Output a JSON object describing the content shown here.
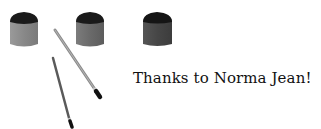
{
  "caption": {
    "text": "Thanks to Norma Jean!"
  },
  "illustration": {
    "paint_pots": [
      {
        "name": "paint-pot-light",
        "body_color": "#8a8a8a"
      },
      {
        "name": "paint-pot-medium",
        "body_color": "#6e6e6e"
      },
      {
        "name": "paint-pot-dark",
        "body_color": "#4a4a4a"
      }
    ],
    "brushes": [
      {
        "name": "paintbrush-long"
      },
      {
        "name": "paintbrush-short"
      }
    ]
  }
}
